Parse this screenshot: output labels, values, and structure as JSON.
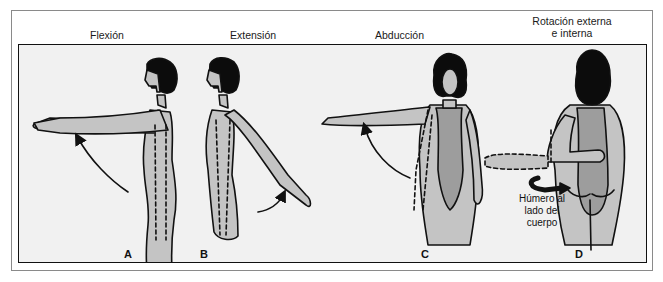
{
  "figure": {
    "panels": [
      {
        "id": "A",
        "title": "Flexión",
        "letter": "A"
      },
      {
        "id": "B",
        "title": "Extensión",
        "letter": "B"
      },
      {
        "id": "C",
        "title": "Abducción",
        "letter": "C"
      },
      {
        "id": "D",
        "title_line1": "Rotación externa",
        "title_line2": "e interna",
        "letter": "D",
        "annotation": [
          "Húmero al",
          "lado del",
          "cuerpo"
        ]
      }
    ],
    "colors": {
      "background": "#f1f1f1",
      "skin": "#c4c4c4",
      "swimsuit": "#9d9d9d",
      "hair": "#0c0c0c",
      "outline": "#111111",
      "frame": "#8a8a8a"
    }
  }
}
